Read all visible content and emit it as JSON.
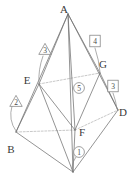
{
  "figure": {
    "background": "#ffffff",
    "line_color": "#6b6b6b",
    "dashed_color": "#a8a8a8",
    "label_color": "#3a3a3a",
    "vertices": [
      {
        "id": "A",
        "label": "A",
        "x": 68,
        "y": 14,
        "label_x": 64,
        "label_y": 13,
        "hidden": false
      },
      {
        "id": "E",
        "label": "E",
        "x": 39,
        "y": 84,
        "label_x": 27,
        "label_y": 80,
        "hidden": false
      },
      {
        "id": "G",
        "label": "G",
        "x": 100,
        "y": 73,
        "label_x": 101,
        "label_y": 66,
        "hidden": false
      },
      {
        "id": "D",
        "label": "D",
        "x": 118,
        "y": 110,
        "label_x": 119,
        "label_y": 113,
        "hidden": false
      },
      {
        "id": "B",
        "label": "B",
        "x": 16,
        "y": 132,
        "label_x": 9,
        "label_y": 150,
        "hidden": false
      },
      {
        "id": "F",
        "label": "F",
        "x": 75,
        "y": 130,
        "label_x": 78,
        "label_y": 131,
        "hidden": false
      },
      {
        "id": "C",
        "label": "",
        "x": 73,
        "y": 172,
        "label_x": 73,
        "label_y": 172,
        "hidden": true
      }
    ],
    "solid_edges": [
      [
        "A",
        "E"
      ],
      [
        "A",
        "B"
      ],
      [
        "A",
        "F"
      ],
      [
        "A",
        "C"
      ],
      [
        "A",
        "G"
      ],
      [
        "A",
        "D"
      ],
      [
        "E",
        "B"
      ],
      [
        "E",
        "F"
      ],
      [
        "E",
        "C"
      ],
      [
        "B",
        "C"
      ],
      [
        "C",
        "D"
      ],
      [
        "C",
        "F"
      ],
      [
        "F",
        "G"
      ],
      [
        "F",
        "D"
      ],
      [
        "G",
        "D"
      ]
    ],
    "dashed_edges": [
      [
        "E",
        "G"
      ],
      [
        "B",
        "F"
      ],
      [
        "F",
        "D"
      ]
    ],
    "markers": [
      {
        "id": "m1",
        "label": "1",
        "shape": "circle",
        "x": 79,
        "y": 152,
        "leader_to_x": 73,
        "leader_to_y": 171
      },
      {
        "id": "m2",
        "label": "2",
        "shape": "triangle",
        "x": 16,
        "y": 101,
        "leader_to_x": 17,
        "leader_to_y": 131
      },
      {
        "id": "m3",
        "label": "3",
        "shape": "triangle",
        "x": 45,
        "y": 49,
        "leader_to_x": 39,
        "leader_to_y": 83
      },
      {
        "id": "m4",
        "label": "4",
        "shape": "square",
        "x": 95,
        "y": 41,
        "leader_to_x": 100,
        "leader_to_y": 72
      },
      {
        "id": "m5",
        "label": "3",
        "shape": "square",
        "x": 113,
        "y": 86,
        "leader_to_x": 117,
        "leader_to_y": 109
      },
      {
        "id": "m6",
        "label": "5",
        "shape": "circle",
        "x": 79,
        "y": 88,
        "leader_to_x": null,
        "leader_to_y": null
      }
    ]
  }
}
